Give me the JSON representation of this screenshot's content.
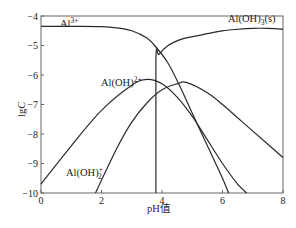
{
  "chart_data": {
    "type": "line",
    "title": "",
    "xlabel": "pH值",
    "ylabel": "lgC",
    "xlim": [
      0,
      8
    ],
    "ylim": [
      -10,
      -4
    ],
    "x_ticks": [
      "0",
      "2",
      "4",
      "6",
      "8"
    ],
    "y_ticks": [
      "-4",
      "-5",
      "-6",
      "-7",
      "-8",
      "-9",
      "-10"
    ],
    "grid": false,
    "legend": "inline labels on curves",
    "series": [
      {
        "name": "Al3+",
        "label_text": "Al",
        "label_sup": "3+",
        "x": [
          0,
          1,
          2,
          2.5,
          3,
          3.5,
          3.8,
          4.2,
          4.6,
          5.0,
          5.5,
          6.0,
          6.2
        ],
        "y": [
          -4.35,
          -4.35,
          -4.36,
          -4.4,
          -4.5,
          -4.75,
          -5.05,
          -5.6,
          -6.4,
          -7.3,
          -8.4,
          -9.5,
          -10
        ]
      },
      {
        "name": "Al(OH)2+",
        "label_text": "Al(OH)",
        "label_sup": "2+",
        "x": [
          0,
          1,
          2,
          3,
          3.5,
          4,
          4.5,
          5,
          5.5,
          6,
          6.5,
          6.8
        ],
        "y": [
          -9.7,
          -8.4,
          -7.2,
          -6.35,
          -6.15,
          -6.3,
          -6.75,
          -7.4,
          -8.2,
          -9.0,
          -9.7,
          -10
        ]
      },
      {
        "name": "Al(OH)2+ (dihydroxo)",
        "label_text": "Al(OH)",
        "label_sub": "2",
        "label_sup": "+",
        "x": [
          1.8,
          2.5,
          3,
          3.5,
          4,
          4.5,
          4.8,
          5.5,
          6,
          6.5,
          7,
          7.5,
          8
        ],
        "y": [
          -10,
          -8.5,
          -7.6,
          -6.95,
          -6.5,
          -6.3,
          -6.25,
          -6.6,
          -7.0,
          -7.45,
          -7.9,
          -8.35,
          -8.8
        ]
      },
      {
        "name": "Al(OH)3(s)",
        "label_text": "Al(OH)",
        "label_sub": "3",
        "label_tail": "(s)",
        "x": [
          3.8,
          3.8,
          3.9,
          4.2,
          4.6,
          5,
          5.5,
          6,
          6.5,
          7,
          7.5,
          8
        ],
        "y": [
          -10,
          -5.5,
          -5.3,
          -5.0,
          -4.8,
          -4.7,
          -4.6,
          -4.5,
          -4.45,
          -4.42,
          -4.42,
          -4.45
        ]
      }
    ]
  },
  "axes": {
    "xlabel": "pH值",
    "ylabel_main": "lg",
    "ylabel_italic": "C"
  },
  "labels": {
    "al3": {
      "text": "Al",
      "sup": "3+"
    },
    "aloh": {
      "text": "Al(OH)",
      "sup": "2+"
    },
    "aloh2": {
      "text": "Al(OH)",
      "sub": "2",
      "sup": "+"
    },
    "aloh3": {
      "text": "Al(OH)",
      "sub": "3",
      "tail": "(s)"
    }
  }
}
